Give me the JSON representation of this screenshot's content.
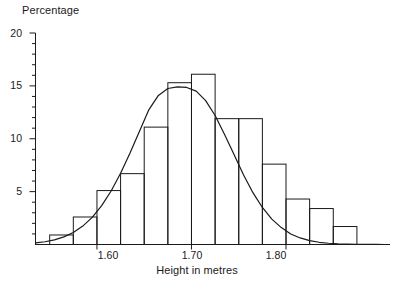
{
  "figure": {
    "background_color": "#ffffff",
    "ink_color": "#1a1a1a"
  },
  "axes": {
    "y_axis_title": "Percentage",
    "x_axis_title": "Height in metres",
    "y_tick_labels": [
      "20",
      "15",
      "10",
      "5"
    ],
    "x_tick_labels": [
      "1.60",
      "1.70",
      "1.80"
    ]
  },
  "chart_data": {
    "type": "bar",
    "title": "",
    "subtitle": "",
    "xlabel": "Height in metres",
    "ylabel": "Percentage",
    "xlim": [
      1.535,
      1.91
    ],
    "ylim": [
      0,
      20
    ],
    "grid": false,
    "legend": null,
    "legend_position": "none",
    "x_major_ticks": [
      1.6,
      1.7,
      1.8
    ],
    "x_major_tick_labels": [
      "1.60",
      "1.70",
      "1.80"
    ],
    "x_minor_tick_interval": 0.025,
    "y_major_ticks": [
      5,
      10,
      15,
      20
    ],
    "y_major_tick_labels": [
      "5",
      "10",
      "15",
      "20"
    ],
    "y_minor_tick_interval": 1,
    "bin_width": 0.025,
    "bin_edges": [
      1.55,
      1.575,
      1.6,
      1.625,
      1.65,
      1.675,
      1.7,
      1.725,
      1.75,
      1.775,
      1.8,
      1.825,
      1.85,
      1.875
    ],
    "categories": [
      "1.550-1.575",
      "1.575-1.600",
      "1.600-1.625",
      "1.625-1.650",
      "1.650-1.675",
      "1.675-1.700",
      "1.700-1.725",
      "1.725-1.750",
      "1.750-1.775",
      "1.775-1.800",
      "1.800-1.825",
      "1.825-1.850",
      "1.850-1.875"
    ],
    "bin_centers": [
      1.5625,
      1.5875,
      1.6125,
      1.6375,
      1.6625,
      1.6875,
      1.7125,
      1.7375,
      1.7625,
      1.7875,
      1.8125,
      1.8375,
      1.8625
    ],
    "values": [
      0.9,
      2.6,
      5.1,
      6.7,
      11.1,
      15.3,
      16.1,
      11.9,
      11.9,
      7.6,
      4.3,
      3.4,
      1.7
    ],
    "series": [
      {
        "name": "Height distribution (histogram)",
        "type": "bar",
        "values": [
          0.9,
          2.6,
          5.1,
          6.7,
          11.1,
          15.3,
          16.1,
          11.9,
          11.9,
          7.6,
          4.3,
          3.4,
          1.7
        ]
      },
      {
        "name": "Fitted normal curve",
        "type": "line",
        "mean": 1.706,
        "std_dev": 0.0425,
        "peak_value": 14.9,
        "x": [
          1.535,
          1.545,
          1.555,
          1.565,
          1.575,
          1.585,
          1.595,
          1.605,
          1.615,
          1.625,
          1.635,
          1.645,
          1.655,
          1.665,
          1.675,
          1.685,
          1.695,
          1.705,
          1.715,
          1.725,
          1.735,
          1.745,
          1.755,
          1.765,
          1.775,
          1.785,
          1.795,
          1.805,
          1.815,
          1.825,
          1.835,
          1.845,
          1.855,
          1.865,
          1.875,
          1.885,
          1.895,
          1.905
        ],
        "values": [
          0.15,
          0.26,
          0.44,
          0.72,
          1.14,
          1.74,
          2.57,
          3.67,
          5.06,
          6.73,
          8.65,
          10.71,
          12.76,
          14.1,
          14.75,
          14.9,
          14.85,
          14.5,
          13.6,
          12.2,
          10.4,
          8.5,
          6.6,
          4.9,
          3.5,
          2.4,
          1.6,
          1.0,
          0.62,
          0.37,
          0.21,
          0.12,
          0.06,
          0.03,
          0.015,
          0.008,
          0.004,
          0.002
        ]
      }
    ]
  }
}
